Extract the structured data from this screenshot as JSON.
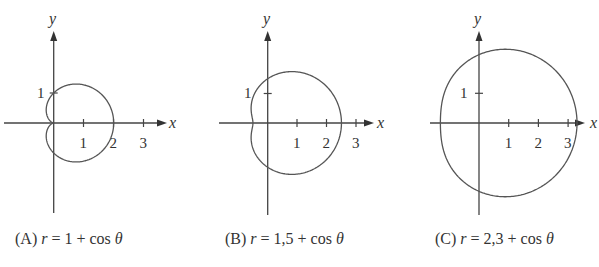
{
  "chart_data": [
    {
      "type": "line",
      "subtype": "polar-curve",
      "title": "(A) r = 1 + cos θ",
      "equation": {
        "a": 1,
        "b": 1,
        "form": "r = a + cos θ"
      },
      "xlabel": "x",
      "ylabel": "y",
      "x_ticks": [
        1,
        2,
        3
      ],
      "y_ticks": [
        1
      ],
      "x_tick_labels": [
        "1",
        "2",
        "3"
      ],
      "y_tick_labels": [
        "1"
      ],
      "xlim": [
        -1.6,
        3.7
      ],
      "ylim": [
        -3.0,
        3.8
      ],
      "grid": false,
      "legend": null,
      "key_points": {
        "x_intercept_right": 2,
        "y_intercepts": [
          1,
          -1
        ],
        "cusp": [
          0,
          0
        ]
      }
    },
    {
      "type": "line",
      "subtype": "polar-curve",
      "title": "(B) r = 1,5 + cos θ",
      "equation": {
        "a": 1.5,
        "b": 1,
        "form": "r = a + cos θ"
      },
      "xlabel": "x",
      "ylabel": "y",
      "x_ticks": [
        1,
        2,
        3
      ],
      "y_ticks": [
        1
      ],
      "x_tick_labels": [
        "1",
        "2",
        "3"
      ],
      "y_tick_labels": [
        "1"
      ],
      "xlim": [
        -1.6,
        3.7
      ],
      "ylim": [
        -3.0,
        3.8
      ],
      "grid": false,
      "legend": null,
      "key_points": {
        "x_intercept_right": 2.5,
        "x_intercept_left": -0.5,
        "y_intercepts": [
          1.5,
          -1.5
        ]
      }
    },
    {
      "type": "line",
      "subtype": "polar-curve",
      "title": "(C) r = 2,3 + cos θ",
      "equation": {
        "a": 2.3,
        "b": 1,
        "form": "r = a + cos θ"
      },
      "xlabel": "x",
      "ylabel": "y",
      "x_ticks": [
        1,
        2,
        3
      ],
      "y_ticks": [
        1
      ],
      "x_tick_labels": [
        "1",
        "2",
        "3"
      ],
      "y_tick_labels": [
        "1"
      ],
      "xlim": [
        -1.6,
        3.7
      ],
      "ylim": [
        -3.0,
        3.8
      ],
      "grid": false,
      "legend": null,
      "key_points": {
        "x_intercept_right": 3.3,
        "x_intercept_left": -1.3,
        "y_intercepts": [
          2.3,
          -2.3
        ]
      }
    }
  ],
  "panels": [
    {
      "id": "A",
      "letter": "(A)",
      "lhs": "r",
      "eq": " = ",
      "rhs": "1 + cos ",
      "theta": "θ",
      "x_label": "x",
      "y_label": "y",
      "tick_x": [
        "1",
        "2",
        "3"
      ],
      "tick_y": "1"
    },
    {
      "id": "B",
      "letter": "(B)",
      "lhs": "r",
      "eq": " = ",
      "rhs": "1,5 + cos ",
      "theta": "θ",
      "x_label": "x",
      "y_label": "y",
      "tick_x": [
        "1",
        "2",
        "3"
      ],
      "tick_y": "1"
    },
    {
      "id": "C",
      "letter": "(C)",
      "lhs": "r",
      "eq": " = ",
      "rhs": "2,3 + cos ",
      "theta": "θ",
      "x_label": "x",
      "y_label": "y",
      "tick_x": [
        "1",
        "2",
        "3"
      ],
      "tick_y": "1"
    }
  ],
  "colors": {
    "axis": "#444444",
    "curve": "#555555",
    "text": "#333333",
    "background": "#ffffff"
  }
}
